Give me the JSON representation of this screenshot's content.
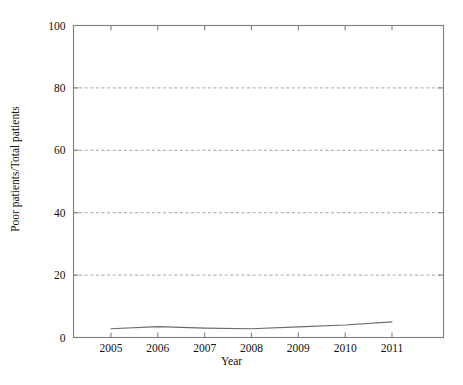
{
  "chart_data": {
    "type": "line",
    "title": "",
    "xlabel": "Year",
    "ylabel": "Poor patients/Total patients",
    "x": [
      2005,
      2006,
      2007,
      2008,
      2009,
      2010,
      2011
    ],
    "xticklabels": [
      "2005",
      "2006",
      "2007",
      "2008",
      "2009",
      "2010",
      "2011"
    ],
    "yticklabels": [
      "0",
      "20",
      "40",
      "60",
      "80",
      "100"
    ],
    "yticks": [
      0,
      20,
      40,
      60,
      80,
      100
    ],
    "ylim": [
      0,
      100
    ],
    "xlim": [
      2004.2,
      2012.1
    ],
    "grid": "horizontal-dashed",
    "legend": "none",
    "series": [
      {
        "name": "Poor patients/Total patients",
        "values": [
          2.8,
          3.5,
          3.0,
          2.8,
          3.4,
          4.0,
          5.0
        ],
        "color": "#6b6b6b"
      }
    ],
    "gridline_values": [
      20,
      40,
      60,
      80
    ],
    "axis_color": "#808080",
    "grid_color": "#9a9a9a",
    "background": "#ffffff"
  }
}
